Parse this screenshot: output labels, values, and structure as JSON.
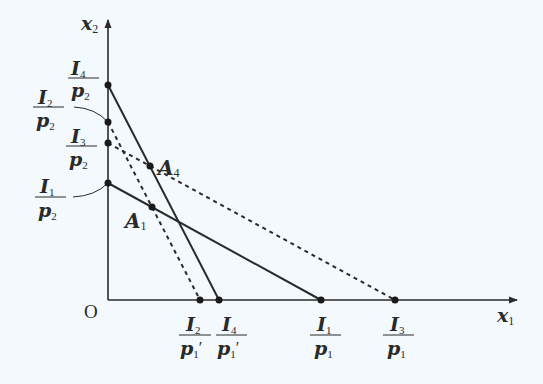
{
  "diagram": {
    "type": "budget-line-diagram",
    "background": "#f3f9fc",
    "ink": "#2a2a2a",
    "axes": {
      "origin_label": "O",
      "x_label": {
        "var": "x",
        "sub": "1"
      },
      "y_label": {
        "var": "x",
        "sub": "2"
      }
    },
    "y_intercepts": [
      {
        "id": "I4_p2",
        "num": "I",
        "num_sub": "4",
        "den": "p",
        "den_sub": "2"
      },
      {
        "id": "I2_p2",
        "num": "I",
        "num_sub": "2",
        "den": "p",
        "den_sub": "2"
      },
      {
        "id": "I3_p2",
        "num": "I",
        "num_sub": "3",
        "den": "p",
        "den_sub": "2"
      },
      {
        "id": "I1_p2",
        "num": "I",
        "num_sub": "1",
        "den": "p",
        "den_sub": "2"
      }
    ],
    "x_intercepts": [
      {
        "id": "I2_p1prime",
        "num": "I",
        "num_sub": "2",
        "den": "p",
        "den_sub": "1",
        "prime": "′"
      },
      {
        "id": "I4_p1prime",
        "num": "I",
        "num_sub": "4",
        "den": "p",
        "den_sub": "1",
        "prime": "′"
      },
      {
        "id": "I1_p1",
        "num": "I",
        "num_sub": "1",
        "den": "p",
        "den_sub": "1"
      },
      {
        "id": "I3_p1",
        "num": "I",
        "num_sub": "3",
        "den": "p",
        "den_sub": "1"
      }
    ],
    "lines": [
      {
        "name": "budget-line-I1",
        "style": "solid",
        "from": "I1/p2",
        "to": "I1/p1"
      },
      {
        "name": "budget-line-I4",
        "style": "solid",
        "from": "I4/p2",
        "to": "I4/p1′"
      },
      {
        "name": "budget-line-I2",
        "style": "dashed",
        "from": "I2/p2",
        "to": "I2/p1′"
      },
      {
        "name": "budget-line-I3",
        "style": "dashed",
        "from": "I3/p2",
        "to": "I3/p1"
      }
    ],
    "points": [
      {
        "id": "A4",
        "label": "A",
        "sub": "4"
      },
      {
        "id": "A1",
        "label": "A",
        "sub": "1"
      }
    ]
  }
}
